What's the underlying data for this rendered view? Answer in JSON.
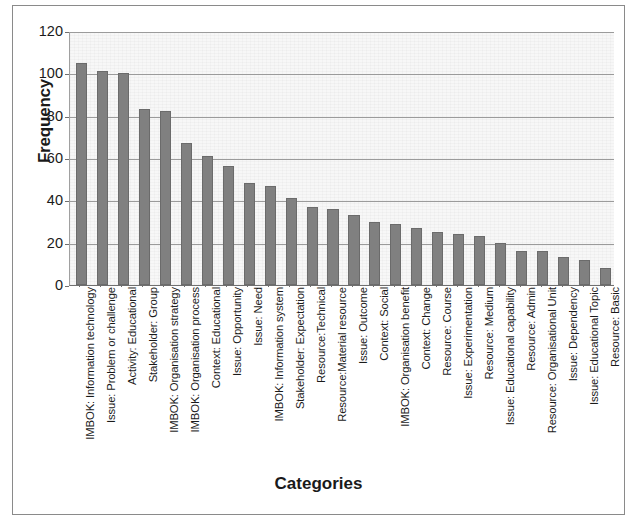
{
  "chart_data": {
    "type": "bar",
    "title": "",
    "xlabel": "Categories",
    "ylabel": "Frequency",
    "ylim": [
      0,
      120
    ],
    "yticks": [
      0,
      20,
      40,
      60,
      80,
      100,
      120
    ],
    "grid": true,
    "legend": "none",
    "bar_color": "#808080",
    "plot_background": "#f7f7f7",
    "categories": [
      "IMBOK: Information technology",
      "Issue: Problem or challenge",
      "Activity: Educational",
      "Stakeholder: Group",
      "IMBOK: Organisation strategy",
      "IMBOK: Organisation process",
      "Context: Educational",
      "Issue: Opportunity",
      "Issue: Need",
      "IMBOK: Information system",
      "Stakeholder: Expectation",
      "Resource:Technical",
      "Resource:Material resource",
      "Issue: Outcome",
      "Context: Social",
      "IMBOK: Organisation benefit",
      "Context: Change",
      "Resource: Course",
      "Issue: Experimentation",
      "Resource: Medium",
      "Issue: Educational capability",
      "Resource: Admin",
      "Resource: Organisational Unit",
      "Issue: Dependency",
      "Issue: Educational Topic",
      "Resource: Basic"
    ],
    "values": [
      105,
      101,
      100,
      83,
      82,
      67,
      61,
      56,
      48,
      47,
      41,
      37,
      36,
      33,
      30,
      29,
      27,
      25,
      24,
      23,
      20,
      16,
      16,
      13,
      12,
      8
    ]
  }
}
